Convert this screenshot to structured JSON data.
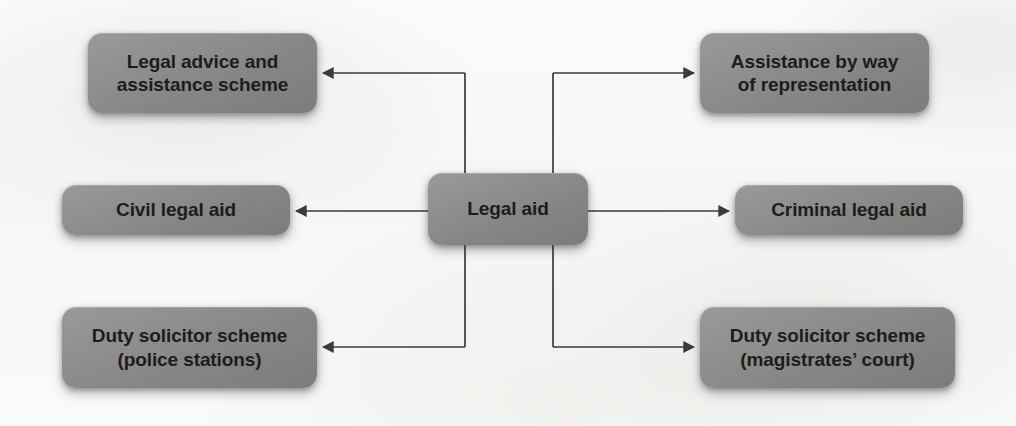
{
  "diagram": {
    "title": "Legal aid",
    "type": "hierarchy-tree",
    "colors": {
      "node_fill": "#8e8e8d",
      "node_text": "#1c1c1c",
      "connector": "#3a3a3a",
      "background": "#fbfbfa"
    },
    "central_node": {
      "id": "legal-aid",
      "label": "Legal aid"
    },
    "branches": [
      {
        "id": "legal-advice-and-assistance-scheme",
        "label": "Legal advice and\nassistance scheme",
        "side": "left",
        "row": "top"
      },
      {
        "id": "assistance-by-way-of-representation",
        "label": "Assistance by way\nof representation",
        "side": "right",
        "row": "top"
      },
      {
        "id": "civil-legal-aid",
        "label": "Civil legal aid",
        "side": "left",
        "row": "middle"
      },
      {
        "id": "criminal-legal-aid",
        "label": "Criminal legal aid",
        "side": "right",
        "row": "middle"
      },
      {
        "id": "duty-solicitor-scheme-police-stations",
        "label": "Duty solicitor scheme\n(police stations)",
        "side": "left",
        "row": "bottom"
      },
      {
        "id": "duty-solicitor-scheme-magistrates-court",
        "label": "Duty solicitor scheme\n(magistrates’ court)",
        "side": "right",
        "row": "bottom"
      }
    ],
    "connectors": [
      {
        "from": "legal-aid",
        "to": "legal-advice-and-assistance-scheme",
        "style": "elbow",
        "arrow": "to"
      },
      {
        "from": "legal-aid",
        "to": "civil-legal-aid",
        "style": "straight",
        "arrow": "to"
      },
      {
        "from": "legal-aid",
        "to": "duty-solicitor-scheme-police-stations",
        "style": "elbow",
        "arrow": "to"
      },
      {
        "from": "legal-aid",
        "to": "assistance-by-way-of-representation",
        "style": "elbow",
        "arrow": "to"
      },
      {
        "from": "legal-aid",
        "to": "criminal-legal-aid",
        "style": "straight",
        "arrow": "to"
      },
      {
        "from": "legal-aid",
        "to": "duty-solicitor-scheme-magistrates-court",
        "style": "elbow",
        "arrow": "to"
      }
    ]
  }
}
